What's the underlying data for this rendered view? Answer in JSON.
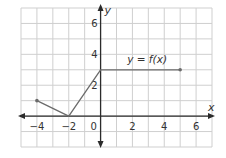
{
  "chart_data": {
    "type": "line",
    "title": "",
    "xlabel": "x",
    "ylabel": "y",
    "xlim": [
      -5,
      7
    ],
    "ylim": [
      -2,
      7
    ],
    "grid": true,
    "x_ticks": [
      -4,
      -2,
      0,
      2,
      4,
      6
    ],
    "y_ticks": [
      2,
      4,
      6
    ],
    "x_tick_labels": [
      "−4",
      "−2",
      "0",
      "2",
      "4",
      "6"
    ],
    "y_tick_labels": [
      "2",
      "4",
      "6"
    ],
    "series": [
      {
        "name": "y = f(x)",
        "points": [
          [
            -4,
            1
          ],
          [
            -2,
            0
          ],
          [
            0,
            3
          ],
          [
            5,
            3
          ]
        ],
        "endpoints": [
          [
            -4,
            1
          ],
          [
            5,
            3
          ]
        ],
        "color": "#6b6b6b"
      }
    ],
    "annotations": [
      {
        "text": "y = f(x)",
        "x": 2.3,
        "y": 3.7
      }
    ]
  },
  "colors": {
    "grid": "#cfcfcf",
    "axis": "#2b2b2b",
    "curve": "#6b6b6b"
  }
}
